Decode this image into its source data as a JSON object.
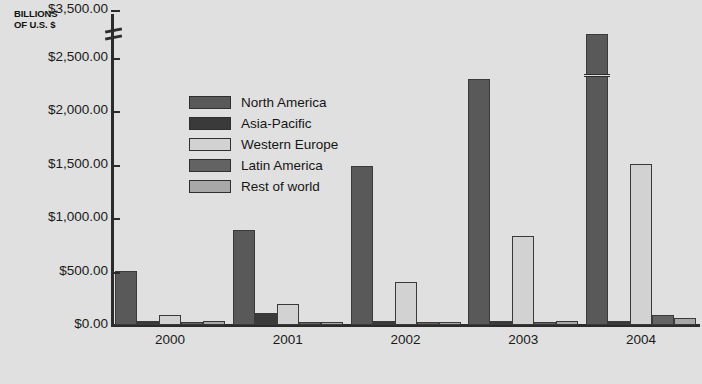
{
  "chart_data": {
    "type": "bar",
    "title": "",
    "subtitle": "",
    "axis_title": "BILLIONS OF U.S. $",
    "axis_title_lines": [
      "BILLIONS",
      "OF U.S. $"
    ],
    "xlabel": "",
    "ylabel": "BILLIONS OF U.S. $",
    "categories": [
      "2000",
      "2001",
      "2002",
      "2003",
      "2004"
    ],
    "ylim": [
      0,
      3500
    ],
    "yticks": [
      0,
      500,
      1000,
      1500,
      2000,
      2500,
      3500
    ],
    "ytick_labels": [
      "$0.00",
      "$500.00",
      "$1,000.00",
      "$1,500.00",
      "$2,000.00",
      "$2,500.00",
      "$3,500.00"
    ],
    "axis_break": {
      "present": true,
      "between": [
        2500,
        3500
      ],
      "note": "broken y-axis between $2,500.00 and $3,500.00"
    },
    "grid": false,
    "legend_position": "inside-upper-left",
    "series": [
      {
        "name": "North America",
        "color": "#595959",
        "values": [
          505,
          890,
          1490,
          2300,
          2800
        ],
        "broken_bars": [
          "2004"
        ]
      },
      {
        "name": "Asia-Pacific",
        "color": "#3a3a3a",
        "values": [
          35,
          115,
          35,
          35,
          35
        ]
      },
      {
        "name": "Western Europe",
        "color": "#d2d2d2",
        "values": [
          90,
          195,
          400,
          830,
          1510
        ]
      },
      {
        "name": "Latin America",
        "color": "#636363",
        "values": [
          25,
          25,
          25,
          25,
          95
        ]
      },
      {
        "name": "Rest of world",
        "color": "#a8a8a8",
        "values": [
          40,
          30,
          30,
          35,
          65
        ]
      }
    ]
  },
  "colors": {
    "background": "#e0e0e0",
    "axis": "#2b2b2b",
    "text": "#1a1a1a"
  },
  "bottom_caption": ""
}
